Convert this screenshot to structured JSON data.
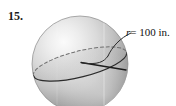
{
  "problem": {
    "number": "15."
  },
  "figure": {
    "type": "sphere-with-great-circle",
    "annotation": {
      "variable": "r",
      "equals": "=",
      "value": "100 in."
    },
    "colors": {
      "sphere_light": "#f2f2f2",
      "sphere_mid": "#c9c9c9",
      "sphere_dark": "#8e8e8e",
      "sphere_shadow": "#6f6f6f",
      "outline": "#7a7a7a",
      "great_circle_solid": "#2b2b2b",
      "great_circle_dashed": "#6a6a6a",
      "radius_line": "#1c1c1c",
      "leader_line": "#2b2b2b",
      "text": "#111111"
    },
    "geometry": {
      "center_x": 80,
      "center_y": 64,
      "radius_px": 48,
      "great_circle_rx": 48,
      "great_circle_ry": 13,
      "great_circle_tilt_deg": -14,
      "radius_line_from": [
        80,
        62
      ],
      "radius_line_to": [
        126,
        70
      ],
      "leader_from": [
        130,
        33
      ],
      "leader_to": [
        82,
        63
      ]
    }
  }
}
